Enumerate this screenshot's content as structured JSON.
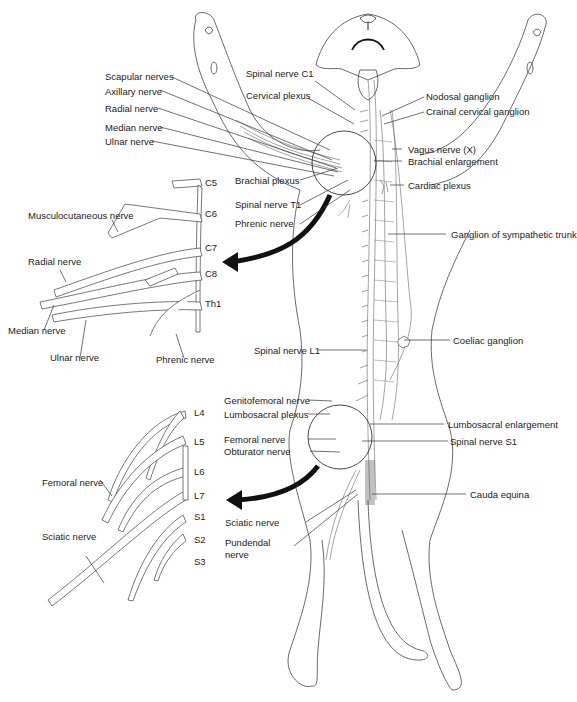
{
  "figure": {
    "accent_color": "#111111",
    "line_color": "#444444",
    "background": "#ffffff"
  },
  "labels_left_upper": {
    "scapular": "Scapular nerves",
    "axillary": "Axillary nerve",
    "radial": "Radial nerve",
    "median": "Median nerve",
    "ulnar": "Ulnar nerve"
  },
  "labels_center_upper": {
    "spinal_c1": "Spinal nerve C1",
    "cervical_plexus": "Cervical plexus",
    "brachial_plexus": "Brachial plexus",
    "spinal_t1": "Spinal nerve T1",
    "phrenic": "Phrenic nerve"
  },
  "labels_right_upper": {
    "nodosal": "Nodosal ganglion",
    "crainal_cervical": "Crainal cervical ganglion",
    "vagus": "Vagus nerve (X)",
    "brachial_enlargement": "Brachial enlargement",
    "cardiac_plexus": "Cardiac plexus",
    "sympathetic_trunk": "Ganglion of sympathetic trunk",
    "coeliac": "Coeliac ganglion"
  },
  "brachial_inset": {
    "segments": [
      "C5",
      "C6",
      "C7",
      "C8",
      "Th1"
    ],
    "musculocutaneous": "Musculocutaneous nerve",
    "radial": "Radial nerve",
    "median": "Median nerve",
    "ulnar": "Ulnar nerve",
    "phrenic": "Phrenic nerve"
  },
  "labels_center_lower": {
    "spinal_l1": "Spinal nerve L1",
    "genitofemoral": "Genitofemoral nerve",
    "lumbosacral_plexus": "Lumbosacral plexus",
    "femoral": "Femoral nerve",
    "obturator": "Obturator nerve",
    "sciatic": "Sciatic nerve",
    "pundendal_line1": "Pundendal",
    "pundendal_line2": "nerve"
  },
  "labels_right_lower": {
    "lumbosacral_enlargement": "Lumbosacral enlargement",
    "spinal_s1": "Spinal nerve S1",
    "cauda_equina": "Cauda equina"
  },
  "lumbosacral_inset": {
    "segments": [
      "L4",
      "L5",
      "L6",
      "L7",
      "S1",
      "S2",
      "S3"
    ],
    "femoral": "Femoral nerve",
    "sciatic": "Sciatic nerve"
  }
}
